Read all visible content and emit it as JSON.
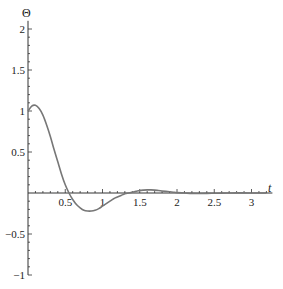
{
  "chart_data": {
    "type": "line",
    "title": "",
    "xlabel": "t",
    "ylabel": "Θ",
    "xlim": [
      0,
      3.2
    ],
    "ylim": [
      -1,
      2.1
    ],
    "grid": false,
    "x_ticks": [
      0.5,
      1,
      1.5,
      2,
      2.5,
      3
    ],
    "x_tick_labels": [
      "0.5",
      "1",
      "1.5",
      "2",
      "2.5",
      "3"
    ],
    "y_ticks": [
      -1,
      -0.5,
      0.5,
      1,
      1.5,
      2
    ],
    "y_tick_labels": [
      "−1",
      "−0.5",
      "0.5",
      "1",
      "1.5",
      "2"
    ],
    "series": [
      {
        "name": "Θ(t)",
        "color": "#777777",
        "x": [
          0,
          0.05,
          0.1,
          0.15,
          0.2,
          0.25,
          0.3,
          0.35,
          0.4,
          0.45,
          0.5,
          0.55,
          0.6,
          0.65,
          0.7,
          0.75,
          0.8,
          0.85,
          0.9,
          0.95,
          1.0,
          1.05,
          1.1,
          1.15,
          1.2,
          1.25,
          1.3,
          1.35,
          1.4,
          1.45,
          1.5,
          1.55,
          1.6,
          1.65,
          1.7,
          1.75,
          1.8,
          1.85,
          1.9,
          1.95,
          2.0,
          2.1,
          2.2,
          2.3,
          2.4,
          2.5,
          2.6,
          2.7,
          2.8,
          2.9,
          3.0,
          3.1,
          3.2
        ],
        "values": [
          1.0,
          1.06,
          1.07,
          1.03,
          0.95,
          0.83,
          0.69,
          0.53,
          0.38,
          0.23,
          0.1,
          0.0,
          -0.08,
          -0.14,
          -0.18,
          -0.21,
          -0.22,
          -0.22,
          -0.21,
          -0.19,
          -0.16,
          -0.13,
          -0.1,
          -0.07,
          -0.05,
          -0.03,
          -0.01,
          0.0,
          0.01,
          0.02,
          0.03,
          0.035,
          0.038,
          0.038,
          0.035,
          0.03,
          0.025,
          0.02,
          0.015,
          0.01,
          0.005,
          0.0,
          -0.005,
          -0.006,
          -0.005,
          -0.003,
          -0.001,
          0.0,
          0.001,
          0.001,
          0.0,
          0.0,
          0.0
        ]
      }
    ]
  }
}
